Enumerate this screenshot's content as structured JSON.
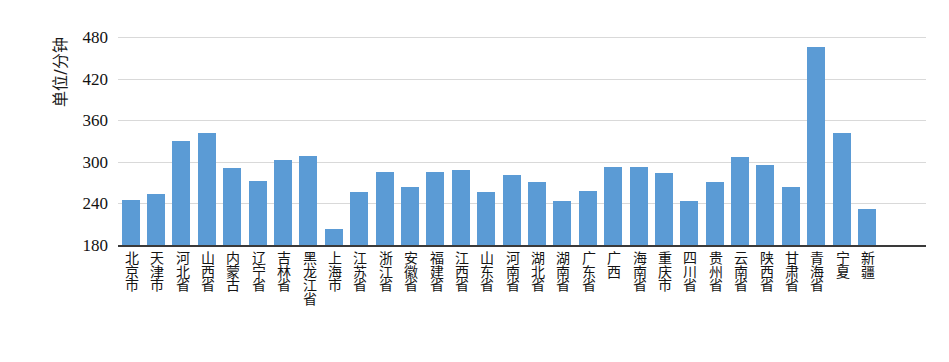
{
  "chart_data": {
    "type": "bar",
    "title": "",
    "xlabel": "",
    "ylabel": "单位/分钟",
    "ylim": [
      180,
      480
    ],
    "ytick_step": 60,
    "yticks": [
      480,
      420,
      360,
      300,
      240,
      180
    ],
    "grid": true,
    "legend": "none",
    "bar_color": "#5B9BD5",
    "categories": [
      "北京市",
      "天津市",
      "河北省",
      "山西省",
      "内蒙古",
      "辽宁省",
      "吉林省",
      "黑龙江省",
      "上海市",
      "江苏省",
      "浙江省",
      "安徽省",
      "福建省",
      "江西省",
      "山东省",
      "河南省",
      "湖北省",
      "湖南省",
      "广东省",
      "广西",
      "海南省",
      "重庆市",
      "四川省",
      "贵州省",
      "云南省",
      "陕西省",
      "甘肃省",
      "青海省",
      "宁夏",
      "新疆"
    ],
    "values": [
      245,
      253,
      330,
      341,
      291,
      272,
      303,
      308,
      203,
      257,
      286,
      264,
      285,
      288,
      257,
      281,
      271,
      243,
      258,
      292,
      293,
      284,
      243,
      271,
      307,
      295,
      263,
      466,
      342,
      232
    ]
  }
}
